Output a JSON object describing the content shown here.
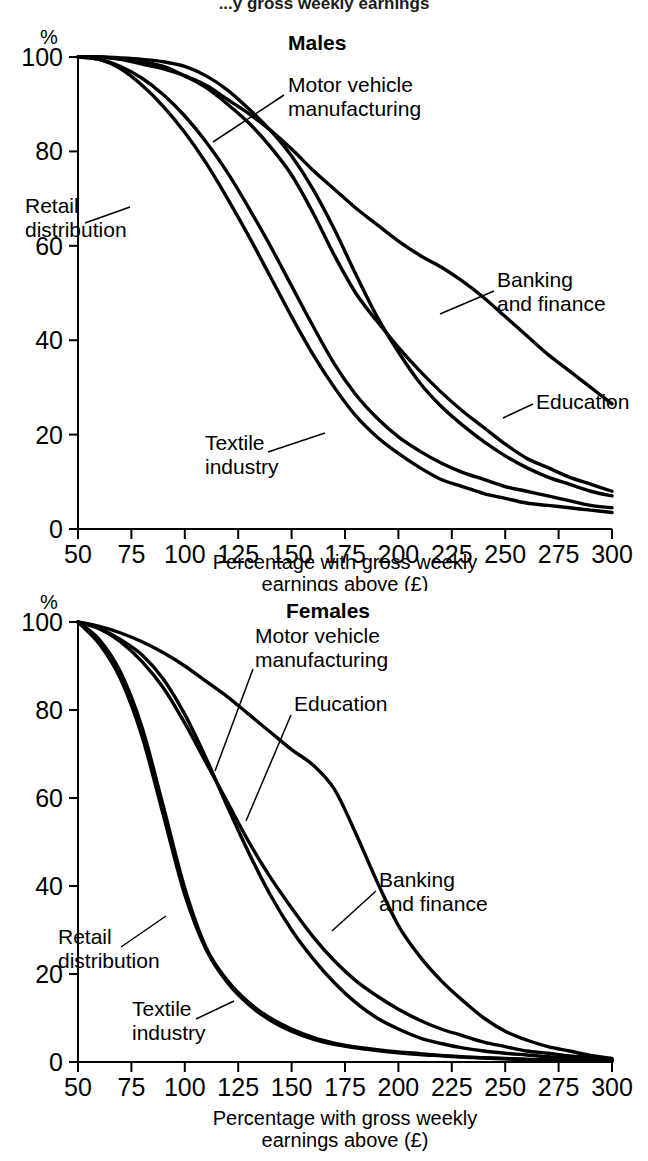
{
  "document": {
    "cropped_heading": "...y gross weekly earnings"
  },
  "chart_data": [
    {
      "id": "males",
      "type": "line",
      "title": "Males",
      "xlabel": "Percentage with gross weekly earnings above (£)",
      "ylabel": "%",
      "xlim": [
        50,
        300
      ],
      "ylim": [
        0,
        100
      ],
      "xticks": [
        50,
        75,
        100,
        125,
        150,
        175,
        200,
        225,
        250,
        275,
        300
      ],
      "yticks": [
        0,
        20,
        40,
        60,
        80,
        100
      ],
      "xticklabels": [
        "50",
        "75",
        "100",
        "125",
        "150",
        "175",
        "200",
        "225",
        "250",
        "275",
        "300"
      ],
      "yticklabels": [
        "0",
        "20",
        "40",
        "60",
        "80",
        "100"
      ],
      "grid": false,
      "legend": "annotated-leader-lines",
      "x": [
        50,
        60,
        70,
        80,
        90,
        100,
        110,
        120,
        130,
        140,
        150,
        160,
        170,
        180,
        190,
        200,
        210,
        220,
        230,
        240,
        250,
        260,
        270,
        280,
        290,
        300
      ],
      "series": [
        {
          "name": "Banking and finance",
          "values": [
            100,
            100,
            99.6,
            99,
            98,
            96,
            94,
            91,
            88,
            84.5,
            80.5,
            76,
            72,
            68,
            64.5,
            61,
            58,
            55.5,
            52.5,
            49,
            45,
            41,
            37,
            33.5,
            30,
            26.5
          ]
        },
        {
          "name": "Education",
          "values": [
            100,
            100,
            99.5,
            98.5,
            97.5,
            96,
            93.5,
            90,
            86,
            81,
            75,
            67,
            58,
            50,
            44,
            38.5,
            33.5,
            29,
            25,
            21.5,
            18,
            15,
            13,
            11,
            9.5,
            8
          ]
        },
        {
          "name": "Motor vehicle manufacturing",
          "values": [
            100,
            100,
            99.8,
            99.5,
            99,
            98,
            96,
            93,
            89,
            84.5,
            79,
            72,
            63.5,
            54,
            45,
            37.5,
            31,
            26,
            22,
            18.5,
            15.5,
            13,
            11,
            9.5,
            8,
            7
          ]
        },
        {
          "name": "Retail distribution",
          "values": [
            100,
            99.5,
            98,
            95.5,
            92,
            87.5,
            82,
            75.5,
            68,
            60,
            51.5,
            43,
            35,
            28.5,
            23.5,
            19.5,
            16.5,
            14,
            12,
            10.5,
            9,
            8,
            7,
            6,
            5,
            4.5
          ]
        },
        {
          "name": "Textile industry",
          "values": [
            100,
            99.5,
            97.5,
            94,
            89.5,
            84,
            77.5,
            70,
            62,
            53.5,
            45,
            37,
            30,
            24,
            19.5,
            16,
            13,
            10.5,
            9,
            7.5,
            6.5,
            5.5,
            5,
            4.5,
            4,
            3.5
          ]
        }
      ],
      "annotations": [
        {
          "text_line1": "Motor vehicle",
          "text_line2": "manufacturing"
        },
        {
          "text_line1": "Retail",
          "text_line2": "distribution"
        },
        {
          "text_line1": "Banking",
          "text_line2": "and finance"
        },
        {
          "text_line1": "Education",
          "text_line2": ""
        },
        {
          "text_line1": "Textile",
          "text_line2": "industry"
        }
      ]
    },
    {
      "id": "females",
      "type": "line",
      "title": "Females",
      "xlabel": "Percentage with gross weekly earnings above (£)",
      "ylabel": "%",
      "xlim": [
        50,
        300
      ],
      "ylim": [
        0,
        100
      ],
      "xticks": [
        50,
        75,
        100,
        125,
        150,
        175,
        200,
        225,
        250,
        275,
        300
      ],
      "yticks": [
        0,
        20,
        40,
        60,
        80,
        100
      ],
      "xticklabels": [
        "50",
        "75",
        "100",
        "125",
        "150",
        "175",
        "200",
        "225",
        "250",
        "275",
        "300"
      ],
      "yticklabels": [
        "0",
        "20",
        "40",
        "60",
        "80",
        "100"
      ],
      "grid": false,
      "legend": "annotated-leader-lines",
      "x": [
        50,
        60,
        70,
        80,
        90,
        100,
        110,
        120,
        130,
        140,
        150,
        160,
        170,
        180,
        190,
        200,
        210,
        220,
        230,
        240,
        250,
        260,
        270,
        280,
        290,
        300
      ],
      "series": [
        {
          "name": "Education",
          "values": [
            100,
            99,
            97.5,
            95.5,
            93,
            90,
            86.5,
            83,
            79,
            75,
            71,
            67.5,
            62,
            52,
            41,
            31,
            24,
            18.5,
            14,
            10,
            7,
            5,
            3.5,
            2.5,
            1.5,
            0.8
          ]
        },
        {
          "name": "Banking and finance",
          "values": [
            100,
            98.5,
            95.5,
            91,
            85,
            77,
            68,
            59,
            50,
            42,
            35,
            28.5,
            23,
            18.5,
            15,
            12,
            9.5,
            7.5,
            6,
            4.5,
            3.5,
            2.5,
            2,
            1.4,
            1,
            0.6
          ]
        },
        {
          "name": "Motor vehicle manufacturing",
          "values": [
            100,
            98.5,
            96,
            92.5,
            87,
            79,
            69,
            58,
            47.5,
            38,
            30,
            23.5,
            18,
            13.5,
            10,
            7.5,
            5.5,
            4.2,
            3.2,
            2.5,
            2,
            1.6,
            1.2,
            0.9,
            0.6,
            0.4
          ]
        },
        {
          "name": "Retail distribution",
          "values": [
            100,
            95,
            87,
            74,
            56,
            38,
            25.5,
            18,
            13,
            9.5,
            7,
            5.2,
            4,
            3.2,
            2.6,
            2.1,
            1.7,
            1.4,
            1.1,
            0.9,
            0.7,
            0.6,
            0.5,
            0.4,
            0.3,
            0.2
          ]
        },
        {
          "name": "Textile industry",
          "values": [
            100,
            96,
            88.5,
            76,
            58,
            39.5,
            26,
            18.5,
            13.5,
            10,
            7.5,
            5.6,
            4.3,
            3.4,
            2.8,
            2.3,
            1.9,
            1.5,
            1.2,
            1.0,
            0.8,
            0.6,
            0.5,
            0.4,
            0.3,
            0.2
          ]
        }
      ],
      "annotations": [
        {
          "text_line1": "Motor vehicle",
          "text_line2": "manufacturing"
        },
        {
          "text_line1": "Education",
          "text_line2": ""
        },
        {
          "text_line1": "Banking",
          "text_line2": "and finance"
        },
        {
          "text_line1": "Retail",
          "text_line2": "distribution"
        },
        {
          "text_line1": "Textile",
          "text_line2": "industry"
        }
      ]
    }
  ],
  "males": {
    "title": "Males",
    "y_unit": "%",
    "xlabel_line1": "Percentage with gross weekly",
    "xlabel_line2": "earnings above (£)",
    "yticks": [
      "100",
      "80",
      "60",
      "40",
      "20",
      "0"
    ],
    "xticks": [
      "50",
      "75",
      "100",
      "125",
      "150",
      "175",
      "200",
      "225",
      "250",
      "275",
      "300"
    ],
    "ann": {
      "motor1": "Motor vehicle",
      "motor2": "manufacturing",
      "retail1": "Retail",
      "retail2": "distribution",
      "banking1": "Banking",
      "banking2": "and finance",
      "education": "Education",
      "textile1": "Textile",
      "textile2": "industry"
    }
  },
  "females": {
    "title": "Females",
    "y_unit": "%",
    "xlabel_line1": "Percentage with gross weekly",
    "xlabel_line2": "earnings above (£)",
    "yticks": [
      "100",
      "80",
      "60",
      "40",
      "20",
      "0"
    ],
    "xticks": [
      "50",
      "75",
      "100",
      "125",
      "150",
      "175",
      "200",
      "225",
      "250",
      "275",
      "300"
    ],
    "ann": {
      "motor1": "Motor vehicle",
      "motor2": "manufacturing",
      "education": "Education",
      "banking1": "Banking",
      "banking2": "and finance",
      "retail1": "Retail",
      "retail2": "distribution",
      "textile1": "Textile",
      "textile2": "industry"
    }
  },
  "colors": {
    "ink": "#000000",
    "paper": "#ffffff"
  }
}
